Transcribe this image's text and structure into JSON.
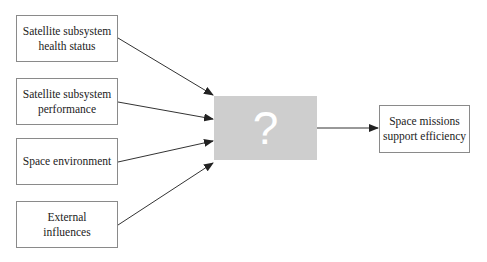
{
  "diagram": {
    "inputs": [
      {
        "label": "Satellite subsystem health status"
      },
      {
        "label": "Satellite subsystem performance"
      },
      {
        "label": "Space environment"
      },
      {
        "label": "External influences"
      }
    ],
    "process": {
      "label": "?",
      "color": "#cecece"
    },
    "output": {
      "label": "Space missions support efficiency"
    },
    "edges": [
      {
        "from": "Satellite subsystem health status",
        "to": "?"
      },
      {
        "from": "Satellite subsystem performance",
        "to": "?"
      },
      {
        "from": "Space environment",
        "to": "?"
      },
      {
        "from": "External influences",
        "to": "?"
      },
      {
        "from": "?",
        "to": "Space missions support efficiency"
      }
    ]
  }
}
